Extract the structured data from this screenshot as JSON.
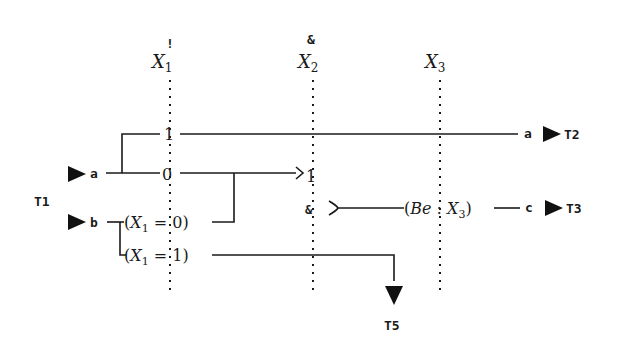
{
  "diagram": {
    "columns": [
      {
        "id": "X1",
        "label": "X",
        "sub": "1",
        "mark": "!",
        "x": 170
      },
      {
        "id": "X2",
        "label": "X",
        "sub": "2",
        "mark": "&",
        "x": 313
      },
      {
        "id": "X3",
        "label": "X",
        "sub": "3",
        "mark": "",
        "x": 440
      }
    ],
    "group_label": "T1",
    "inputs": [
      {
        "label": "a"
      },
      {
        "label": "b"
      }
    ],
    "nodes": {
      "branch_one": "1",
      "branch_zero": "0",
      "cond_x1_0": {
        "pre": "(",
        "var": "X",
        "sub": "1",
        "post": " = 0)"
      },
      "cond_x1_1": {
        "pre": "(",
        "var": "X",
        "sub": "1",
        "post": " = 1)"
      },
      "merge_one": "1",
      "and_mark": "&",
      "be_node": {
        "pre": "(",
        "var": "Be",
        "sep": " : ",
        "var2": "X",
        "sub": "3",
        "post": ")"
      }
    },
    "outputs": [
      {
        "signal": "a",
        "target": "T2"
      },
      {
        "signal": "c",
        "target": "T3"
      },
      {
        "signal": "",
        "target": "T5"
      }
    ],
    "colors": {
      "ink": "#1a1a1a",
      "background": "#ffffff"
    }
  }
}
